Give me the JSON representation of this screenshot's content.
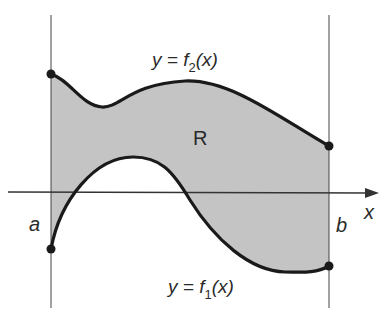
{
  "figure": {
    "region_label": "R",
    "upper_curve_label": {
      "prefix": "y = f",
      "subscript": "2",
      "suffix": "(x)"
    },
    "lower_curve_label": {
      "prefix": "y = f",
      "subscript": "1",
      "suffix": "(x)"
    },
    "x_axis_label": "x",
    "left_bound_label": "a",
    "right_bound_label": "b"
  },
  "colors": {
    "fill": "#c4c4c4",
    "curve": "#1a1a1a",
    "axis": "#333333",
    "background": "#ffffff"
  }
}
